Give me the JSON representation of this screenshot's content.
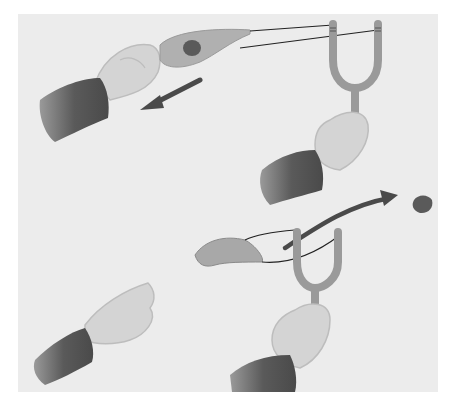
{
  "illustration": {
    "description": "Two-step slingshot illustration: pulling back the pouch, then releasing the stone",
    "panels": [
      {
        "step": 1,
        "action": "pull-back",
        "arrow_direction": "down-left"
      },
      {
        "step": 2,
        "action": "release",
        "arrow_direction": "up-right"
      }
    ],
    "colors": {
      "background": "#ececec",
      "skin": "#cfcfcf",
      "sleeve": "#555555",
      "slingshot": "#9a9a9a",
      "pouch": "#a8a8a8",
      "arrow": "#4a4a4a",
      "stone": "#6a6a6a"
    }
  }
}
